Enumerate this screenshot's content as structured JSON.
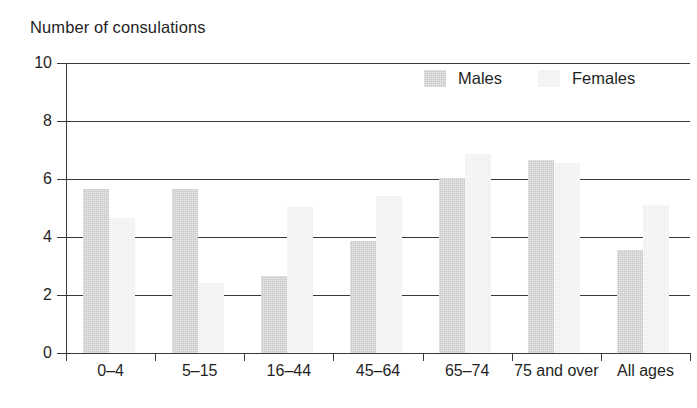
{
  "chart_data": {
    "type": "bar",
    "title": "Number of consulations",
    "xlabel": "",
    "ylabel": "",
    "ylim": [
      0,
      10
    ],
    "yticks": [
      0,
      2,
      4,
      6,
      8,
      10
    ],
    "ytick_labels": [
      "0",
      "2",
      "4",
      "6",
      "8",
      "10"
    ],
    "grid": true,
    "grid_axis": "y",
    "legend_position": "top-right",
    "categories": [
      "0–4",
      "5–15",
      "16–44",
      "45–64",
      "65–74",
      "75 and over",
      "All ages"
    ],
    "series": [
      {
        "name": "Males",
        "color": "#c9c9c9",
        "values": [
          5.65,
          5.65,
          2.65,
          3.85,
          6.05,
          6.65,
          3.55
        ]
      },
      {
        "name": "Females",
        "color": "#ededed",
        "values": [
          4.65,
          2.4,
          5.05,
          5.4,
          6.85,
          6.55,
          5.1
        ]
      }
    ]
  },
  "legend": {
    "items": [
      {
        "label": "Males",
        "swatch": "male"
      },
      {
        "label": "Females",
        "swatch": "female"
      }
    ]
  },
  "axis": {
    "y_label_values": [
      "10",
      "8",
      "6",
      "4",
      "2",
      "0"
    ]
  }
}
